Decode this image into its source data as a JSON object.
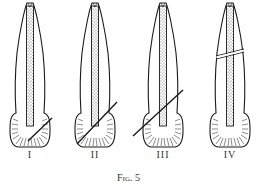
{
  "figure": {
    "caption": "Fig. 5",
    "panels": [
      {
        "label": "I",
        "description": "tooth with short oblique line across crown tip"
      },
      {
        "label": "II",
        "description": "tooth with long oblique line through crown"
      },
      {
        "label": "III",
        "description": "tooth with oblique line through crown and canal end"
      },
      {
        "label": "IV",
        "description": "tooth with horizontal fracture line across root"
      }
    ],
    "colors": {
      "ink": "#1a1a1a",
      "background": "#ffffff"
    }
  }
}
